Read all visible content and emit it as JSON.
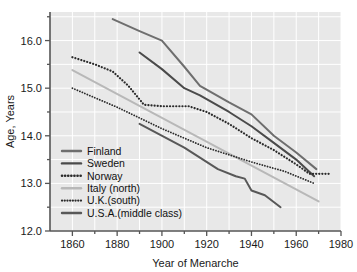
{
  "chart_data": {
    "type": "line",
    "title": "",
    "xlabel": "Year of Menarche",
    "ylabel": "Age, Years",
    "xlim": [
      1850,
      1980
    ],
    "ylim": [
      12.0,
      16.6
    ],
    "xticks": [
      1860,
      1880,
      1900,
      1920,
      1940,
      1960,
      1980
    ],
    "xtick_labels": [
      "1860",
      "1880",
      "1900",
      "1920",
      "1940",
      "1960",
      "1980"
    ],
    "xminor_step": 10,
    "yticks": [
      12.0,
      13.0,
      14.0,
      15.0,
      16.0
    ],
    "ytick_labels": [
      "12.0",
      "13.0",
      "14.0",
      "15.0",
      "16.0"
    ],
    "yminor_step": 0.5,
    "grid": true,
    "grid_color": "#ffffff",
    "plot_background": "#e8e8e8",
    "legend_position": "lower-left-inside",
    "series": [
      {
        "name": "Finland",
        "label": "Finland",
        "color": "#6e6e6e",
        "style": "solid",
        "width": 2.0,
        "x": [
          1878,
          1890,
          1900,
          1910,
          1917,
          1930,
          1940,
          1950,
          1960,
          1969
        ],
        "y": [
          16.45,
          16.2,
          16.0,
          15.45,
          15.05,
          14.7,
          14.45,
          14.0,
          13.65,
          13.3
        ]
      },
      {
        "name": "Sweden",
        "label": "Sweden",
        "color": "#4a4a4a",
        "style": "solid",
        "width": 2.0,
        "x": [
          1890,
          1900,
          1910,
          1917,
          1930,
          1940,
          1950,
          1960,
          1968
        ],
        "y": [
          15.75,
          15.4,
          15.0,
          14.85,
          14.5,
          14.2,
          13.85,
          13.5,
          13.15
        ]
      },
      {
        "name": "Norway",
        "label": "Norway",
        "color": "#2b2b2b",
        "style": "dotted",
        "width": 2.2,
        "x": [
          1860,
          1870,
          1878,
          1885,
          1892,
          1900,
          1912,
          1920,
          1930,
          1940,
          1950,
          1960,
          1966,
          1970,
          1975
        ],
        "y": [
          15.65,
          15.5,
          15.35,
          15.05,
          14.65,
          14.62,
          14.62,
          14.5,
          14.25,
          13.95,
          13.7,
          13.4,
          13.2,
          13.2,
          13.2
        ]
      },
      {
        "name": "Italy (north)",
        "label": "Italy (north)",
        "color": "#b8b8b8",
        "style": "solid",
        "width": 2.0,
        "x": [
          1860,
          1970
        ],
        "y": [
          15.38,
          12.62
        ]
      },
      {
        "name": "U.K.(south)",
        "label": "U.K.(south)",
        "color": "#2b2b2b",
        "style": "dotted",
        "width": 1.8,
        "x": [
          1860,
          1880,
          1900,
          1920,
          1940,
          1955,
          1968
        ],
        "y": [
          15.0,
          14.6,
          14.15,
          13.75,
          13.45,
          13.25,
          13.0
        ]
      },
      {
        "name": "U.S.A.(middle class)",
        "label": "U.S.A.(middle class)",
        "color": "#585858",
        "style": "solid",
        "width": 2.0,
        "x": [
          1890,
          1910,
          1925,
          1933,
          1937,
          1940,
          1946,
          1953
        ],
        "y": [
          14.25,
          13.75,
          13.3,
          13.15,
          13.1,
          12.85,
          12.75,
          12.5
        ]
      }
    ]
  },
  "legend": {
    "entries": [
      {
        "label": "Finland"
      },
      {
        "label": "Sweden"
      },
      {
        "label": "Norway"
      },
      {
        "label": "Italy (north)"
      },
      {
        "label": "U.K.(south)"
      },
      {
        "label": "U.S.A.(middle class)"
      }
    ]
  },
  "axes": {
    "x_title": "Year of Menarche",
    "y_title": "Age, Years"
  }
}
